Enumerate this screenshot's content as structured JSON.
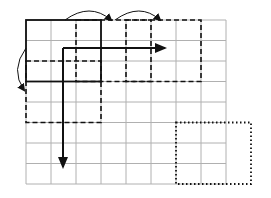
{
  "diagram": {
    "title": "",
    "colors": {
      "grid": "#b0b0b0",
      "stroke": "#111111",
      "background": "#ffffff"
    },
    "grid": {
      "x0": 26,
      "y0": 20,
      "cols": 8,
      "rows": 8,
      "cell_w": 25,
      "cell_h": 20.5
    },
    "windows": [
      {
        "name": "solid-window",
        "style": "solid",
        "col": 0,
        "row": 0,
        "w": 3,
        "h": 3
      },
      {
        "name": "dashed-window-right-1",
        "style": "dashed",
        "col": 2,
        "row": 0,
        "w": 3,
        "h": 3
      },
      {
        "name": "dashed-window-right-2",
        "style": "dashed",
        "col": 4,
        "row": 0,
        "w": 3,
        "h": 3
      },
      {
        "name": "dashed-window-down",
        "style": "dashed",
        "col": 0,
        "row": 2,
        "w": 3,
        "h": 3
      },
      {
        "name": "dotted-window-final",
        "style": "dotted",
        "col": 6,
        "row": 5,
        "w": 3,
        "h": 3
      }
    ],
    "arrows": [
      {
        "name": "horizontal-direction-arrow",
        "x1": 63,
        "y1": 48,
        "x2": 165,
        "y2": 48
      },
      {
        "name": "vertical-direction-arrow",
        "x1": 63,
        "y1": 48,
        "x2": 63,
        "y2": 167
      }
    ],
    "curved_arrows": [
      {
        "name": "stride-arrow-right-1",
        "from": [
          65,
          20
        ],
        "ctrl": [
          90,
          2
        ],
        "to": [
          111,
          20
        ]
      },
      {
        "name": "stride-arrow-right-2",
        "from": [
          115,
          20
        ],
        "ctrl": [
          140,
          2
        ],
        "to": [
          160,
          20
        ]
      },
      {
        "name": "stride-arrow-down",
        "from": [
          26,
          48
        ],
        "ctrl": [
          10,
          70
        ],
        "to": [
          24,
          90
        ]
      }
    ]
  }
}
